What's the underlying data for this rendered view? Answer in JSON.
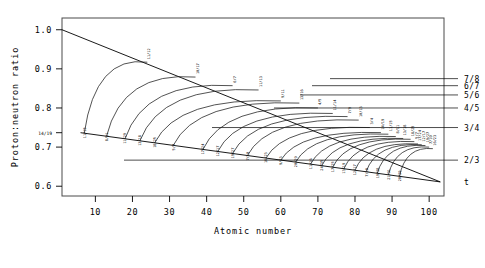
{
  "chart_data": {
    "type": "line",
    "title": "",
    "xlabel": "Atomic number",
    "ylabel": "Proton:neutron ratio",
    "xlim": [
      1,
      104
    ],
    "ylim": [
      0.575,
      1.03
    ],
    "grid": false,
    "legend_position": "none",
    "xticks": [
      10,
      20,
      30,
      40,
      50,
      60,
      70,
      80,
      90,
      100
    ],
    "yticks": [
      "1.0",
      "0.9",
      "0.8",
      "0.7",
      "0.6"
    ],
    "ytick_values": [
      1.0,
      0.9,
      0.8,
      0.7,
      0.6
    ],
    "y_annotation": {
      "label": "14/19",
      "value": 0.7368
    },
    "right_axis_labels": [
      {
        "label": "7/8",
        "value": 0.875
      },
      {
        "label": "6/7",
        "value": 0.857
      },
      {
        "label": "5/6",
        "value": 0.8333
      },
      {
        "label": "4/5",
        "value": 0.8
      },
      {
        "label": "3/4",
        "value": 0.75
      },
      {
        "label": "2/3",
        "value": 0.6667
      },
      {
        "label": "t",
        "value": 0.611
      }
    ],
    "series": [
      {
        "name": "upper-boundary",
        "type": "line",
        "points": [
          [
            1,
            1.0
          ],
          [
            103,
            0.611
          ]
        ]
      },
      {
        "name": "lower-boundary",
        "type": "line",
        "points": [
          [
            6,
            0.7368
          ],
          [
            103,
            0.611
          ]
        ]
      }
    ],
    "arcs": [
      {
        "ratio": "11/12",
        "start_label": "11/15",
        "end_label": "11/12",
        "x_start": 7,
        "x_end": 24,
        "y_end": 0.917
      },
      {
        "ratio": "10/17",
        "start_label": "8/11",
        "end_label": "10/17",
        "x_start": 13,
        "x_end": 37,
        "y_end": 0.879
      },
      {
        "ratio": "6/7",
        "start_label": "11/29",
        "end_label": "6/7",
        "x_start": 18,
        "x_end": 47,
        "y_end": 0.857
      },
      {
        "ratio": "11/13",
        "start_label": "13/18",
        "end_label": "11/13",
        "x_start": 22,
        "x_end": 54,
        "y_end": 0.846
      },
      {
        "ratio": "9/11",
        "start_label": "18/25",
        "end_label": "9/11",
        "x_start": 26,
        "x_end": 60,
        "y_end": 0.818
      },
      {
        "ratio": "13/16",
        "start_label": "5/7",
        "end_label": "13/16",
        "x_start": 31,
        "x_end": 65,
        "y_end": 0.8125
      },
      {
        "ratio": "4/5",
        "start_label": "17/24",
        "end_label": "4/5",
        "x_start": 39,
        "x_end": 70,
        "y_end": 0.8
      },
      {
        "ratio": "11/14",
        "start_label": "12/17",
        "end_label": "11/14",
        "x_start": 43,
        "x_end": 74,
        "y_end": 0.786
      },
      {
        "ratio": "7/9",
        "start_label": "19/27",
        "end_label": "7/9",
        "x_start": 47,
        "x_end": 78,
        "y_end": 0.778
      },
      {
        "ratio": "10/13",
        "start_label": "7/10",
        "end_label": "10/13",
        "x_start": 51,
        "x_end": 81,
        "y_end": 0.769
      },
      {
        "ratio": "3/4",
        "start_label": "16/23",
        "end_label": "3/4",
        "x_start": 56,
        "x_end": 84,
        "y_end": 0.75
      },
      {
        "ratio": "14/19",
        "start_label": "9/13",
        "end_label": "14/19",
        "x_start": 60,
        "x_end": 87,
        "y_end": 0.737
      },
      {
        "ratio": "11/15",
        "start_label": "20/29",
        "end_label": "11/15",
        "x_start": 64,
        "x_end": 89,
        "y_end": 0.733
      },
      {
        "ratio": "8/11",
        "start_label": "11/16",
        "end_label": "8/11",
        "x_start": 68,
        "x_end": 91,
        "y_end": 0.727
      },
      {
        "ratio": "13/18",
        "start_label": "24/35",
        "end_label": "13/18",
        "x_start": 71,
        "x_end": 93,
        "y_end": 0.722
      },
      {
        "ratio": "18/25",
        "start_label": "17/25",
        "end_label": "18/25",
        "x_start": 74,
        "x_end": 95,
        "y_end": 0.72
      },
      {
        "ratio": "5/7",
        "start_label": "13/19",
        "end_label": "5/7",
        "x_start": 77,
        "x_end": 96,
        "y_end": 0.714
      },
      {
        "ratio": "17/24",
        "start_label": "12/17",
        "end_label": "17/24",
        "x_start": 80,
        "x_end": 97,
        "y_end": 0.708
      },
      {
        "ratio": "12/17",
        "start_label": "7/10",
        "end_label": "12/17",
        "x_start": 83,
        "x_end": 98,
        "y_end": 0.706
      },
      {
        "ratio": "19/27",
        "start_label": "19/28",
        "end_label": "19/27",
        "x_start": 86,
        "x_end": 99,
        "y_end": 0.704
      },
      {
        "ratio": "7/10",
        "start_label": "21/31",
        "end_label": "7/10",
        "x_start": 89,
        "x_end": 100,
        "y_end": 0.7
      },
      {
        "ratio": "16/23",
        "start_label": "20/29",
        "end_label": "16/23",
        "x_start": 92,
        "x_end": 101,
        "y_end": 0.696
      }
    ]
  }
}
